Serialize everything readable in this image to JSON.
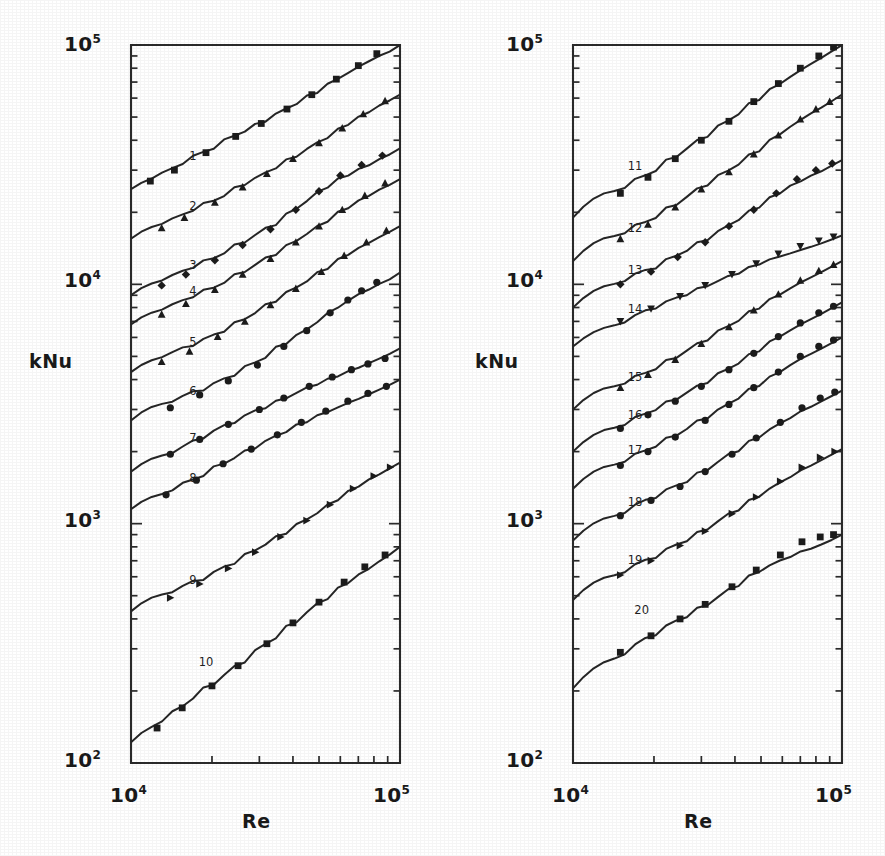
{
  "figure": {
    "background_color": "#ffffff",
    "ink_color": "#1f1f1f"
  },
  "panels": [
    {
      "id": "left",
      "ylabel": "kNu",
      "xlabel": "Re",
      "x_tick_low": "10",
      "x_tick_low_exp": "4",
      "x_tick_high": "10",
      "x_tick_high_exp": "5",
      "y_tick_labels": [
        {
          "base": "10",
          "exp": "5"
        },
        {
          "base": "10",
          "exp": "4"
        },
        {
          "base": "10",
          "exp": "3"
        },
        {
          "base": "10",
          "exp": "2"
        }
      ]
    },
    {
      "id": "right",
      "ylabel": "kNu",
      "xlabel": "Re",
      "x_tick_low": "10",
      "x_tick_low_exp": "4",
      "x_tick_high": "10",
      "x_tick_high_exp": "5",
      "y_tick_labels": [
        {
          "base": "10",
          "exp": "5"
        },
        {
          "base": "10",
          "exp": "4"
        },
        {
          "base": "10",
          "exp": "3"
        },
        {
          "base": "10",
          "exp": "2"
        }
      ]
    }
  ],
  "chart_data": {
    "type": "line",
    "title": "",
    "subtitle": "",
    "xlabel": "Re",
    "ylabel": "kNu",
    "xscale": "log",
    "yscale": "log",
    "xlim": [
      10000,
      100000
    ],
    "ylim": [
      100,
      100000
    ],
    "grid": false,
    "legend": "inline-curve-numbers",
    "x_tick_labels": [
      "10^4",
      "10^5"
    ],
    "y_tick_labels": [
      "10^2",
      "10^3",
      "10^4",
      "10^5"
    ],
    "panel_count": 2,
    "panels": [
      {
        "id": "left",
        "curve_labels": [
          "1",
          "2",
          "3",
          "4",
          "5",
          "6",
          "7",
          "8",
          "9",
          "10"
        ],
        "series": [
          {
            "name": "1",
            "label_x": 17000,
            "label_y": 33000,
            "x": [
              10000,
              100000
            ],
            "y": [
              25000,
              100000
            ],
            "marker": "square",
            "points_x": [
              11800,
              14500,
              19000,
              24500,
              30500,
              38000,
              47000,
              58000,
              70000,
              82000
            ],
            "points_y": [
              27000,
              30000,
              35500,
              41500,
              47000,
              54000,
              62000,
              72000,
              82000,
              92000
            ]
          },
          {
            "name": "2",
            "label_x": 17000,
            "label_y": 20500,
            "x": [
              10000,
              100000
            ],
            "y": [
              15500,
              62000
            ],
            "marker": "triangle-up",
            "points_x": [
              13000,
              15800,
              20500,
              26000,
              32000,
              40000,
              50000,
              61000,
              73000,
              88000
            ],
            "points_y": [
              17200,
              19000,
              22000,
              25500,
              29000,
              33500,
              39000,
              45000,
              51500,
              58500
            ]
          },
          {
            "name": "3",
            "label_x": 17000,
            "label_y": 11600,
            "x": [
              10000,
              100000
            ],
            "y": [
              9000,
              37000
            ],
            "marker": "diamond",
            "points_x": [
              13000,
              16000,
              20500,
              26000,
              33000,
              41000,
              50000,
              60000,
              72000,
              86000
            ],
            "points_y": [
              9900,
              11000,
              12600,
              14600,
              17000,
              20500,
              24500,
              28500,
              31500,
              34500
            ]
          },
          {
            "name": "4",
            "label_x": 17000,
            "label_y": 9000,
            "x": [
              10000,
              100000
            ],
            "y": [
              6800,
              27500
            ],
            "marker": "triangle-up",
            "points_x": [
              13000,
              16000,
              20500,
              26000,
              33000,
              41000,
              50000,
              61000,
              74000,
              88000
            ],
            "points_y": [
              7500,
              8300,
              9500,
              11000,
              12800,
              15000,
              17500,
              20500,
              23500,
              26500
            ]
          },
          {
            "name": "5",
            "label_x": 17000,
            "label_y": 5500,
            "x": [
              10000,
              100000
            ],
            "y": [
              4300,
              17500
            ],
            "marker": "triangle-up",
            "points_x": [
              13000,
              16500,
              21000,
              26500,
              33000,
              41000,
              51000,
              62000,
              75000,
              89000
            ],
            "points_y": [
              4750,
              5250,
              6050,
              7000,
              8200,
              9600,
              11300,
              13200,
              15000,
              16800
            ]
          },
          {
            "name": "6",
            "label_x": 17000,
            "label_y": 3450,
            "x": [
              10000,
              100000
            ],
            "y": [
              2700,
              11200
            ],
            "marker": "circle",
            "points_x": [
              14000,
              18000,
              23000,
              29500,
              37000,
              45000,
              55000,
              64000,
              72000,
              82000
            ],
            "points_y": [
              3050,
              3450,
              3950,
              4600,
              5500,
              6400,
              7600,
              8600,
              9400,
              10200
            ]
          },
          {
            "name": "7",
            "label_x": 17000,
            "label_y": 2200,
            "x": [
              10000,
              100000
            ],
            "y": [
              1650,
              5400
            ],
            "marker": "circle",
            "points_x": [
              14000,
              18000,
              23000,
              30000,
              37000,
              46000,
              56000,
              66000,
              76000,
              88000
            ],
            "points_y": [
              1950,
              2250,
              2600,
              3000,
              3350,
              3750,
              4100,
              4400,
              4650,
              4900
            ]
          },
          {
            "name": "8",
            "label_x": 17000,
            "label_y": 1500,
            "x": [
              10000,
              100000
            ],
            "y": [
              1150,
              4000
            ],
            "marker": "circle",
            "points_x": [
              13500,
              17500,
              22000,
              28000,
              35000,
              43000,
              53000,
              64000,
              76000,
              89000
            ],
            "points_y": [
              1320,
              1520,
              1780,
              2050,
              2350,
              2650,
              2950,
              3250,
              3500,
              3750
            ]
          },
          {
            "name": "9",
            "label_x": 17000,
            "label_y": 560,
            "x": [
              10000,
              100000
            ],
            "y": [
              430,
              1800
            ],
            "marker": "triangle-right",
            "points_x": [
              14000,
              18000,
              23000,
              29000,
              36000,
              45000,
              55000,
              67000,
              80000,
              92000
            ],
            "points_y": [
              490,
              560,
              650,
              760,
              880,
              1030,
              1200,
              1400,
              1580,
              1720
            ]
          },
          {
            "name": "10",
            "label_x": 19000,
            "label_y": 255,
            "x": [
              10000,
              100000
            ],
            "y": [
              122,
              800
            ],
            "marker": "square",
            "points_x": [
              12500,
              15500,
              20000,
              25000,
              32000,
              40000,
              50000,
              62000,
              74000,
              88000
            ],
            "points_y": [
              140,
              170,
              210,
              255,
              315,
              385,
              470,
              570,
              660,
              740
            ]
          }
        ]
      },
      {
        "id": "right",
        "curve_labels": [
          "11",
          "12",
          "13",
          "14",
          "15",
          "16",
          "17",
          "18",
          "19",
          "20"
        ],
        "series": [
          {
            "name": "11",
            "label_x": 17000,
            "label_y": 30000,
            "x": [
              10000,
              100000
            ],
            "y": [
              19000,
              100000
            ],
            "marker": "square",
            "points_x": [
              15000,
              19000,
              24000,
              30000,
              38000,
              47000,
              58000,
              70000,
              82000,
              93000
            ],
            "points_y": [
              24000,
              28000,
              33500,
              40000,
              48000,
              58000,
              69000,
              80000,
              90000,
              98000
            ]
          },
          {
            "name": "12",
            "label_x": 17000,
            "label_y": 16500,
            "x": [
              10000,
              100000
            ],
            "y": [
              12500,
              62000
            ],
            "marker": "triangle-up",
            "points_x": [
              15000,
              19000,
              24000,
              30000,
              38000,
              47000,
              58000,
              70000,
              80000,
              90000
            ],
            "points_y": [
              15500,
              17800,
              21000,
              25000,
              29500,
              35000,
              42000,
              49000,
              54000,
              58000
            ]
          },
          {
            "name": "13",
            "label_x": 17000,
            "label_y": 11000,
            "x": [
              10000,
              100000
            ],
            "y": [
              8000,
              33000
            ],
            "marker": "diamond",
            "points_x": [
              15000,
              19500,
              24500,
              31000,
              38000,
              47000,
              57000,
              68000,
              80000,
              92000
            ],
            "points_y": [
              10000,
              11300,
              13000,
              15000,
              17500,
              20500,
              24000,
              27500,
              30000,
              32000
            ]
          },
          {
            "name": "14",
            "label_x": 17000,
            "label_y": 7600,
            "x": [
              10000,
              100000
            ],
            "y": [
              5500,
              16000
            ],
            "marker": "triangle-down",
            "points_x": [
              15000,
              19500,
              25000,
              31000,
              39000,
              48000,
              58000,
              70000,
              82000,
              93000
            ],
            "points_y": [
              7000,
              7900,
              8900,
              9900,
              11000,
              12200,
              13400,
              14400,
              15200,
              15800
            ]
          },
          {
            "name": "15",
            "label_x": 17000,
            "label_y": 3950,
            "x": [
              10000,
              100000
            ],
            "y": [
              3000,
              12500
            ],
            "marker": "triangle-up",
            "points_x": [
              15000,
              19000,
              24000,
              30000,
              38000,
              47000,
              58000,
              70000,
              82000,
              93000
            ],
            "points_y": [
              3700,
              4200,
              4850,
              5650,
              6650,
              7800,
              9100,
              10400,
              11400,
              12100
            ]
          },
          {
            "name": "16",
            "label_x": 17000,
            "label_y": 2750,
            "x": [
              10000,
              100000
            ],
            "y": [
              2000,
              8400
            ],
            "marker": "circle",
            "points_x": [
              15000,
              19000,
              24000,
              30000,
              38000,
              47000,
              58000,
              70000,
              82000,
              93000
            ],
            "points_y": [
              2500,
              2850,
              3250,
              3750,
              4400,
              5150,
              6050,
              6900,
              7600,
              8100
            ]
          },
          {
            "name": "17",
            "label_x": 17000,
            "label_y": 1950,
            "x": [
              10000,
              100000
            ],
            "y": [
              1400,
              6000
            ],
            "marker": "circle",
            "points_x": [
              15000,
              19000,
              24000,
              31000,
              38000,
              47000,
              58000,
              70000,
              82000,
              93000
            ],
            "points_y": [
              1750,
              2000,
              2300,
              2700,
              3150,
              3700,
              4300,
              5000,
              5500,
              5850
            ]
          },
          {
            "name": "18",
            "label_x": 17000,
            "label_y": 1180,
            "x": [
              10000,
              100000
            ],
            "y": [
              850,
              3600
            ],
            "marker": "circle",
            "points_x": [
              15000,
              19500,
              25000,
              31000,
              39000,
              48000,
              59000,
              71000,
              83000,
              94000
            ],
            "points_y": [
              1080,
              1250,
              1430,
              1650,
              1950,
              2280,
              2650,
              3050,
              3350,
              3550
            ]
          },
          {
            "name": "19",
            "label_x": 17000,
            "label_y": 680,
            "x": [
              10000,
              100000
            ],
            "y": [
              480,
              2050
            ],
            "marker": "triangle-right",
            "points_x": [
              15000,
              19500,
              25000,
              31000,
              39000,
              48000,
              59000,
              71000,
              83000,
              94000
            ],
            "points_y": [
              610,
              700,
              810,
              930,
              1100,
              1290,
              1500,
              1720,
              1890,
              2000
            ]
          },
          {
            "name": "20",
            "label_x": 18000,
            "label_y": 420,
            "x": [
              10000,
              100000
            ],
            "y": [
              205,
              900
            ],
            "marker": "square",
            "points_x": [
              15000,
              19500,
              25000,
              31000,
              39000,
              48000,
              59000,
              71000,
              83000,
              93000
            ],
            "points_y": [
              290,
              340,
              400,
              460,
              545,
              640,
              740,
              840,
              880,
              900
            ]
          }
        ]
      }
    ]
  }
}
